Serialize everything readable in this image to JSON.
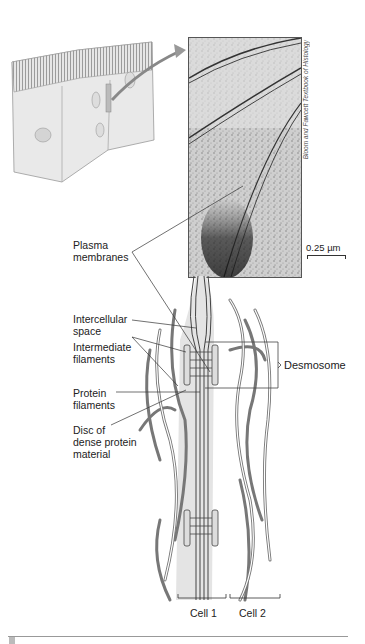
{
  "figure": {
    "credit": "Bloom and Fawcett Textbook of Histology",
    "scale_bar": "0.25 µm",
    "labels": {
      "plasma_membranes": [
        "Plasma",
        "membranes"
      ],
      "intercellular_space": [
        "Intercellular",
        "space"
      ],
      "intermediate_filaments": [
        "Intermediate",
        "filaments"
      ],
      "protein_filaments": [
        "Protein",
        "filaments"
      ],
      "disc": [
        "Disc of",
        "dense protein",
        "material"
      ],
      "desmosome": "Desmosome",
      "cell1": "Cell 1",
      "cell2": "Cell 2"
    }
  }
}
